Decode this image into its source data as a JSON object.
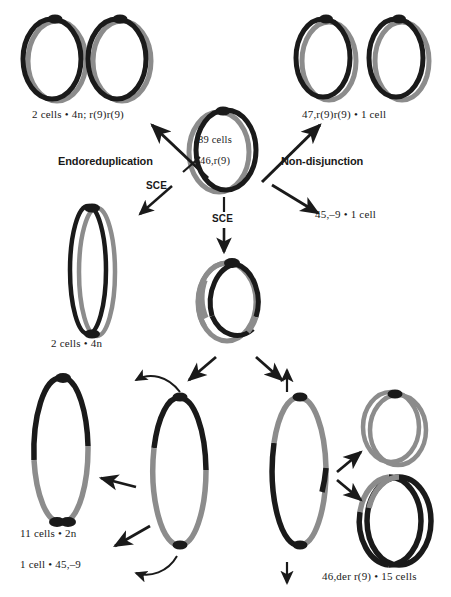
{
  "figure": {
    "background": "#ffffff",
    "colors": {
      "black_chromatid": "#1a1a1a",
      "gray_chromatid": "#8c8c8c",
      "text": "#1a1a1a",
      "arrow": "#1a1a1a"
    }
  },
  "labels": {
    "endoreduplication_product": "2 cells • 4n; r(9)r(9)",
    "nondisjunction_product": "47,r(9)r(9) • 1 cell",
    "parent_cells": "89 cells",
    "parent_karyotype": "46,r(9)",
    "endoreduplication": "Endoreduplication",
    "nondisjunction": "Non-disjunction",
    "sce_left": "SCE",
    "sce_center": "SCE",
    "monosomy_product": "45,–9 • 1 cell",
    "tetraploid_product": "2 cells • 4n",
    "diploid_product": "11 cells • 2n",
    "monosomy_bottom": "1 cell • 45,–9",
    "der_product": "46,der r(9) • 15 cells"
  },
  "rings": [
    {
      "name": "ring-top-left-a",
      "group": "endoreduplication-product",
      "cx": 55,
      "cy": 60,
      "rx": 30,
      "ry": 41,
      "style": "double-offset",
      "outer_color": "#1a1a1a",
      "inner_color": "#8c8c8c",
      "centromere": true
    },
    {
      "name": "ring-top-left-b",
      "group": "endoreduplication-product",
      "cx": 118,
      "cy": 60,
      "rx": 30,
      "ry": 41,
      "style": "double-offset",
      "outer_color": "#1a1a1a",
      "inner_color": "#8c8c8c",
      "centromere": true
    },
    {
      "name": "ring-top-right-a",
      "group": "nondisjunction-product",
      "cx": 324,
      "cy": 58,
      "rx": 28,
      "ry": 40,
      "style": "double-offset",
      "outer_color": "#1a1a1a",
      "inner_color": "#8c8c8c",
      "centromere": true
    },
    {
      "name": "ring-top-right-b",
      "group": "nondisjunction-product",
      "cx": 398,
      "cy": 58,
      "rx": 28,
      "ry": 40,
      "style": "double-offset",
      "outer_color": "#1a1a1a",
      "inner_color": "#8c8c8c",
      "centromere": true
    },
    {
      "name": "ring-parent-center",
      "group": "parent",
      "cx": 224,
      "cy": 150,
      "rx": 31,
      "ry": 41,
      "style": "double-offset",
      "outer_color": "#1a1a1a",
      "inner_color": "#8c8c8c",
      "centromere": true
    },
    {
      "name": "ring-tetraploid-elongated",
      "group": "tetraploid-product",
      "cx": 92,
      "cy": 272,
      "rx": 20,
      "ry": 65,
      "style": "double-offset-narrow",
      "outer_color": "#1a1a1a",
      "inner_color": "#8c8c8c",
      "centromere": true
    },
    {
      "name": "ring-sce-product",
      "group": "sce-product",
      "cx": 233,
      "cy": 302,
      "rx": 30,
      "ry": 40,
      "style": "segmented-double",
      "outer_color": "#1a1a1a",
      "inner_color": "#8c8c8c",
      "centromere": true
    },
    {
      "name": "ring-diploid-elongated",
      "group": "diploid-product",
      "cx": 60,
      "cy": 450,
      "rx": 28,
      "ry": 76,
      "style": "segmented-double-half",
      "outer_color": "#1a1a1a",
      "inner_color": "#8c8c8c",
      "centromere": true
    },
    {
      "name": "ring-bridge-left",
      "group": "anaphase-bridge",
      "cx": 180,
      "cy": 470,
      "rx": 28,
      "ry": 77,
      "style": "segmented-single-half",
      "outer_color": "#1a1a1a",
      "inner_color": "#8c8c8c",
      "centromere": true
    },
    {
      "name": "ring-bridge-right",
      "group": "anaphase-bridge",
      "cx": 300,
      "cy": 470,
      "rx": 28,
      "ry": 77,
      "style": "segmented-single-half-inv",
      "outer_color": "#1a1a1a",
      "inner_color": "#8c8c8c",
      "centromere": true
    },
    {
      "name": "ring-der-small-gray",
      "group": "der-product",
      "cx": 394,
      "cy": 428,
      "rx": 29,
      "ry": 36,
      "style": "double-offset-gray",
      "outer_color": "#8c8c8c",
      "inner_color": "#8c8c8c",
      "centromere": true
    },
    {
      "name": "ring-der-large-black",
      "group": "der-product",
      "cx": 393,
      "cy": 519,
      "rx": 33,
      "ry": 45,
      "style": "double-offset-mixed",
      "outer_color": "#1a1a1a",
      "inner_color": "#8c8c8c",
      "centromere": false
    }
  ],
  "arrows": [
    {
      "name": "arrow-to-endoreduplication-product",
      "type": "straight",
      "x1": 210,
      "y1": 175,
      "x2": 148,
      "y2": 122
    },
    {
      "name": "arrow-to-nondisjunction-product",
      "type": "straight",
      "x1": 258,
      "y1": 180,
      "x2": 325,
      "y2": 122
    },
    {
      "name": "arrow-sce-left",
      "type": "dashed",
      "x1": 200,
      "y1": 160,
      "x2": 140,
      "y2": 212
    },
    {
      "name": "arrow-sce-center",
      "type": "dashed-vertical",
      "x1": 224,
      "y1": 195,
      "x2": 224,
      "y2": 250
    },
    {
      "name": "arrow-to-monosomy",
      "type": "straight",
      "x1": 272,
      "y1": 180,
      "x2": 320,
      "y2": 212
    },
    {
      "name": "arrow-sce-product-to-left",
      "type": "straight",
      "x1": 215,
      "y1": 355,
      "x2": 186,
      "y2": 380
    },
    {
      "name": "arrow-sce-product-to-right",
      "type": "straight",
      "x1": 258,
      "y1": 355,
      "x2": 284,
      "y2": 380
    },
    {
      "name": "arrow-curved-to-diploid",
      "type": "curved",
      "x1": 180,
      "y1": 390,
      "x2": 133,
      "y2": 382
    },
    {
      "name": "arrow-bridge-to-diploid",
      "type": "straight",
      "x1": 136,
      "y1": 485,
      "x2": 100,
      "y2": 478
    },
    {
      "name": "arrow-bridge-to-monosomy",
      "type": "straight",
      "x1": 150,
      "y1": 525,
      "x2": 113,
      "y2": 545
    },
    {
      "name": "arrow-curved-bottom",
      "type": "curved-bottom",
      "x1": 178,
      "y1": 560,
      "x2": 133,
      "y2": 573
    },
    {
      "name": "arrow-bridge-right-up",
      "type": "vertical-up",
      "x1": 287,
      "y1": 390,
      "x2": 287,
      "y2": 372
    },
    {
      "name": "arrow-bridge-right-down",
      "type": "vertical-down",
      "x1": 287,
      "y1": 562,
      "x2": 287,
      "y2": 582
    },
    {
      "name": "arrow-to-der-gray",
      "type": "straight",
      "x1": 336,
      "y1": 470,
      "x2": 362,
      "y2": 452
    },
    {
      "name": "arrow-to-der-black",
      "type": "straight",
      "x1": 336,
      "y1": 478,
      "x2": 362,
      "y2": 498
    }
  ]
}
